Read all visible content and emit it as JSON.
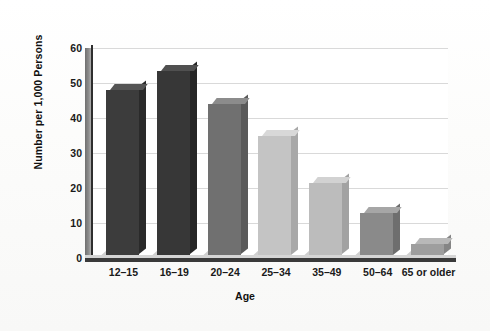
{
  "chart_data": {
    "type": "bar",
    "title": "",
    "xlabel": "Age",
    "ylabel": "Number per 1,000 Persons",
    "categories": [
      "12–15",
      "16–19",
      "20–24",
      "25–34",
      "35–49",
      "50–64",
      "65 or older"
    ],
    "values": [
      48,
      53.5,
      44,
      35,
      21.5,
      13,
      4
    ],
    "ylim": [
      0,
      60
    ],
    "yticks": [
      0,
      10,
      20,
      30,
      40,
      50,
      60
    ],
    "ytick_labels": [
      "0",
      "10",
      "20",
      "30",
      "40",
      "50",
      "60"
    ],
    "grid": "horizontal",
    "legend": "none",
    "bar_colors": [
      "#3c3c3c",
      "#373737",
      "#707070",
      "#c4c4c4",
      "#bcbcbc",
      "#8a8a8a",
      "#9e9e9e"
    ],
    "bar_top_colors": [
      "#555555",
      "#505050",
      "#8c8c8c",
      "#d8d8d8",
      "#d2d2d2",
      "#a6a6a6",
      "#b8b8b8"
    ],
    "bar_side_colors": [
      "#2a2a2a",
      "#262626",
      "#5a5a5a",
      "#a8a8a8",
      "#a2a2a2",
      "#6e6e6e",
      "#858585"
    ],
    "style": "3d-bar",
    "background_color": "#ffffff",
    "gridline_color": "#d9d9d9",
    "axis_color": "#2e2e2e"
  }
}
